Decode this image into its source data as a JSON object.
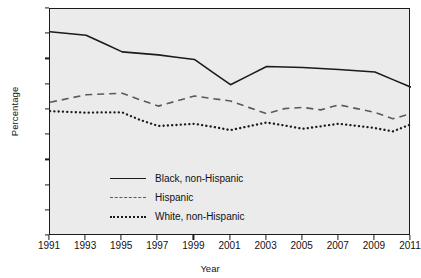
{
  "chart_data": {
    "type": "line",
    "title": "",
    "xlabel": "Year",
    "ylabel": "Percentage",
    "x": [
      1991,
      1992,
      1993,
      1994,
      1995,
      1996,
      1997,
      1998,
      1999,
      2000,
      2001,
      2002,
      2003,
      2004,
      2005,
      2006,
      2007,
      2008,
      2009,
      2010,
      2011
    ],
    "xlim": [
      1991,
      2011
    ],
    "ylim": [
      0,
      90
    ],
    "ytick_values": [
      0,
      10,
      20,
      30,
      40,
      50,
      60,
      70,
      80,
      90
    ],
    "xtick_values": [
      1991,
      1993,
      1995,
      1997,
      1999,
      2001,
      2003,
      2005,
      2007,
      2009,
      2011
    ],
    "xtick_labels": [
      "1991",
      "1993",
      "1995",
      "1997",
      "1999",
      "2001",
      "2003",
      "2005",
      "2007",
      "2009",
      "2011"
    ],
    "ytick_labels": [
      "0",
      "10",
      "20",
      "30",
      "40",
      "50",
      "60",
      "70",
      "80",
      "90"
    ],
    "grid": false,
    "legend_position": "inside-lower-left",
    "plot_background": "#ebebeb",
    "series": [
      {
        "name": "Black, non-Hispanic",
        "style": "solid",
        "color": "#1b1b1b",
        "values": [
          81.0,
          80.3,
          79.6,
          76.3,
          73.0,
          72.4,
          71.8,
          70.9,
          70.0,
          65.0,
          60.0,
          63.6,
          67.2,
          67.0,
          66.8,
          66.4,
          66.0,
          65.5,
          65.0,
          62.0,
          59.0
        ]
      },
      {
        "name": "Hispanic",
        "style": "dashed",
        "color": "#5a5a5a",
        "values": [
          53.0,
          54.5,
          56.0,
          56.3,
          56.6,
          54.0,
          51.5,
          53.5,
          55.5,
          54.5,
          53.5,
          51.0,
          48.5,
          50.5,
          51.0,
          50.0,
          52.0,
          50.5,
          49.0,
          46.5,
          48.5
        ]
      },
      {
        "name": "White, non-Hispanic",
        "style": "dotted",
        "color": "#1b1b1b",
        "values": [
          49.5,
          49.2,
          48.9,
          49.0,
          49.0,
          46.0,
          43.6,
          44.0,
          44.5,
          43.3,
          42.0,
          43.5,
          45.0,
          43.8,
          42.5,
          43.5,
          44.5,
          43.7,
          42.8,
          41.5,
          44.3
        ]
      }
    ]
  }
}
